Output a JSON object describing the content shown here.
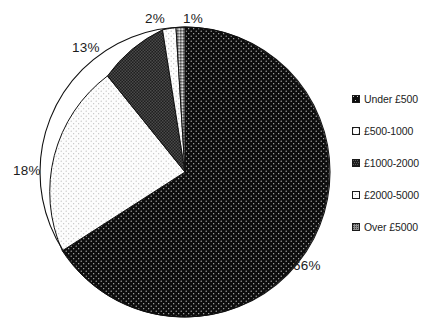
{
  "chart_data": {
    "type": "pie",
    "title": "",
    "subtitle": "",
    "xlabel": "",
    "ylabel": "",
    "grid": false,
    "legend_position": "right",
    "start_angle_deg": 0,
    "direction": "clockwise",
    "categories": [
      "Under £500",
      "£500-1000",
      "£1000-2000",
      "£2000-5000",
      "Over £5000"
    ],
    "values": [
      66,
      18,
      13,
      2,
      1
    ],
    "data_labels": [
      "66%",
      "18%",
      "13%",
      "2%",
      "1%"
    ],
    "units": "percent",
    "total": 100,
    "slice_fills": [
      "black-dotted",
      "white-light-dotted",
      "dark-crosshatch",
      "white-light-dotted",
      "gray-crosshatch"
    ],
    "slice_colors": [
      "#0d0d0d",
      "#fbfbfb",
      "#262626",
      "#f2f2f2",
      "#8a8a8a"
    ]
  },
  "pie": {
    "labels": {
      "under500": "66%",
      "p500_1000": "18%",
      "p1000_2000": "13%",
      "p2000_5000": "2%",
      "over5000": "1%"
    }
  },
  "legend": {
    "items": [
      {
        "label": "Under £500",
        "swatch": "black-dotted",
        "value": 66
      },
      {
        "label": "£500-1000",
        "swatch": "white-light-dotted",
        "value": 18
      },
      {
        "label": "£1000-2000",
        "swatch": "dark-crosshatch",
        "value": 13
      },
      {
        "label": "£2000-5000",
        "swatch": "white-light-dotted",
        "value": 2
      },
      {
        "label": "Over £5000",
        "swatch": "gray-crosshatch",
        "value": 1
      }
    ]
  },
  "colors": {
    "background": "#ffffff",
    "text": "#1c1c1c",
    "outline": "#1a1a1a"
  }
}
